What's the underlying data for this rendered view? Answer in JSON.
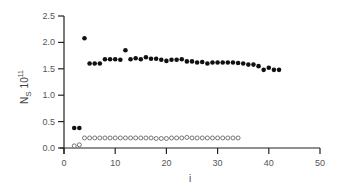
{
  "chart_data": {
    "type": "scatter",
    "title": "",
    "xlabel": "i",
    "ylabel": "N_S 10^11",
    "ylabel_main": "N",
    "ylabel_sub": "S",
    "ylabel_factor": "10",
    "ylabel_exp": "11",
    "xlim": [
      0,
      50
    ],
    "ylim": [
      0,
      2.5
    ],
    "xticks": [
      0,
      10,
      20,
      30,
      40,
      50
    ],
    "yticks": [
      "0.0",
      "0.5",
      "1.0",
      "1.5",
      "2.0",
      "2.5"
    ],
    "grid": false,
    "legend": null,
    "series": [
      {
        "name": "filled",
        "marker": "filled-circle",
        "x": [
          2,
          3,
          4,
          5,
          6,
          7,
          8,
          9,
          10,
          11,
          12,
          13,
          14,
          15,
          16,
          17,
          18,
          19,
          20,
          21,
          22,
          23,
          24,
          25,
          26,
          27,
          28,
          29,
          30,
          31,
          32,
          33,
          34,
          35,
          36,
          37,
          38,
          39,
          40,
          41,
          42
        ],
        "y": [
          0.38,
          0.38,
          2.08,
          1.6,
          1.6,
          1.6,
          1.68,
          1.68,
          1.68,
          1.67,
          1.85,
          1.68,
          1.7,
          1.68,
          1.72,
          1.69,
          1.69,
          1.67,
          1.65,
          1.67,
          1.67,
          1.68,
          1.64,
          1.64,
          1.62,
          1.63,
          1.6,
          1.62,
          1.62,
          1.62,
          1.62,
          1.62,
          1.61,
          1.6,
          1.58,
          1.58,
          1.55,
          1.48,
          1.52,
          1.48,
          1.48
        ]
      },
      {
        "name": "open",
        "marker": "open-circle",
        "x": [
          2,
          3,
          4,
          5,
          6,
          7,
          8,
          9,
          10,
          11,
          12,
          13,
          14,
          15,
          16,
          17,
          18,
          19,
          20,
          21,
          22,
          23,
          24,
          25,
          26,
          27,
          28,
          29,
          30,
          31,
          32,
          33,
          34
        ],
        "y": [
          0.04,
          0.06,
          0.19,
          0.19,
          0.19,
          0.19,
          0.19,
          0.19,
          0.19,
          0.19,
          0.19,
          0.19,
          0.19,
          0.19,
          0.19,
          0.19,
          0.18,
          0.18,
          0.18,
          0.19,
          0.19,
          0.19,
          0.2,
          0.19,
          0.19,
          0.19,
          0.19,
          0.19,
          0.19,
          0.19,
          0.19,
          0.19,
          0.19
        ]
      }
    ]
  }
}
